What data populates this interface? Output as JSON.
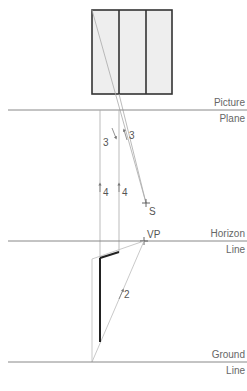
{
  "diagram": {
    "type": "perspective-construction",
    "lines": {
      "picture_plane": {
        "label_top": "Picture",
        "label_bottom": "Plane"
      },
      "horizon_line": {
        "label_top": "Horizon",
        "label_bottom": "Line"
      },
      "ground_line": {
        "label_top": "Ground",
        "label_bottom": "Line"
      }
    },
    "points": {
      "station_point": "S",
      "vanishing_point": "VP"
    },
    "step_labels": {
      "step2": "2",
      "step3a": "3",
      "step3b": "3",
      "step4a": "4",
      "step4b": "4"
    },
    "colors": {
      "guide_line": "#999999",
      "construction_line": "#bbbbbb",
      "building_outline": "#333333",
      "building_fill": "#eeeeee",
      "thick_edge": "#222222"
    }
  }
}
